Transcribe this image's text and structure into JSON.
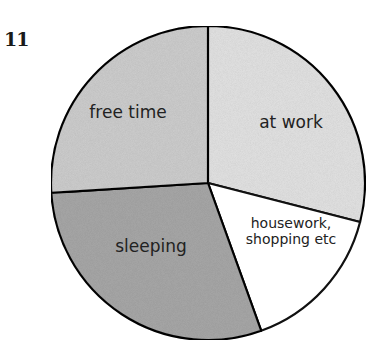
{
  "figure_number": "11",
  "chart_data": {
    "type": "pie",
    "title": "",
    "start_angle_deg": 0,
    "direction": "clockwise",
    "categories": [
      "at work",
      "housework, shopping etc",
      "sleeping",
      "free time"
    ],
    "values": [
      29,
      15.5,
      29.5,
      26
    ],
    "unit": "percent of day (approx.)",
    "colors": [
      "#e4e4e4",
      "#ffffff",
      "#a9a9a9",
      "#cfcfcf"
    ],
    "labels": [
      {
        "lines": [
          "at work"
        ]
      },
      {
        "lines": [
          "housework,",
          "shopping etc"
        ]
      },
      {
        "lines": [
          "sleeping"
        ]
      },
      {
        "lines": [
          "free time"
        ]
      }
    ],
    "legend": "none (labels inside slices)",
    "grid": false
  }
}
